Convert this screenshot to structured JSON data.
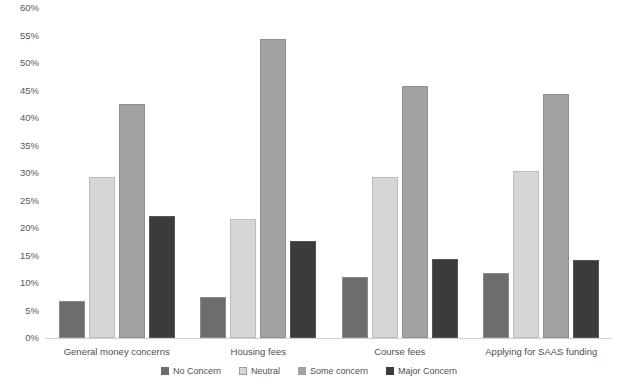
{
  "chart_data": {
    "type": "bar",
    "title": "",
    "subtitle": "",
    "xlabel": "",
    "ylabel": "",
    "ylim": [
      0,
      60
    ],
    "ytick_labels": [
      "60%",
      "55%",
      "50%",
      "45%",
      "40%",
      "35%",
      "30%",
      "25%",
      "20%",
      "15%",
      "10%",
      "5%",
      "0%"
    ],
    "ytick_values": [
      60,
      55,
      50,
      45,
      40,
      35,
      30,
      25,
      20,
      15,
      10,
      5,
      0
    ],
    "grid": false,
    "legend_position": "bottom",
    "categories": [
      "General money concerns",
      "Housing fees",
      "Course fees",
      "Applying for SAAS funding"
    ],
    "series": [
      {
        "name": "No Concern",
        "color": "#6d6d6d",
        "values": [
          6.7,
          7.5,
          11.1,
          11.9
        ]
      },
      {
        "name": "Neutral",
        "color": "#d6d6d6",
        "values": [
          29.2,
          21.6,
          29.2,
          30.4
        ]
      },
      {
        "name": "Some concern",
        "color": "#a2a2a2",
        "values": [
          42.6,
          54.4,
          45.9,
          44.3
        ]
      },
      {
        "name": "Major Concern",
        "color": "#3b3b3b",
        "values": [
          22.1,
          17.7,
          14.3,
          14.2
        ]
      }
    ]
  }
}
